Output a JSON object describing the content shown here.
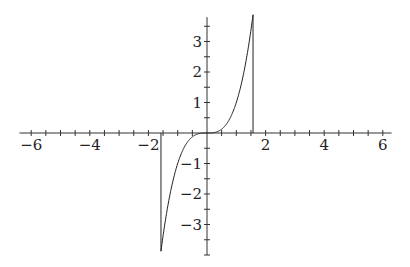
{
  "chart_data": {
    "type": "line",
    "title": "",
    "xlabel": "",
    "ylabel": "",
    "function": "y = x^3",
    "domain": [
      -1.5708,
      1.5708
    ],
    "xlim": [
      -6.4,
      6.3
    ],
    "ylim": [
      -4.0,
      3.8
    ],
    "grid": false,
    "legend": null,
    "x_ticks_major": [
      -6,
      -4,
      -2,
      2,
      4,
      6
    ],
    "x_tick_labels": [
      "−6",
      "−4",
      "−2",
      "2",
      "4",
      "6"
    ],
    "x_tick_minor_step": 0.5,
    "y_ticks_major": [
      -3,
      -2,
      -1,
      1,
      2,
      3
    ],
    "y_tick_labels": [
      "−3",
      "−2",
      "−1",
      "1",
      "2",
      "3"
    ],
    "y_tick_minor_step": 0.5,
    "vertical_lines": [
      -1.5708,
      1.5708
    ],
    "series": [
      {
        "name": "x^3",
        "color": "#222222",
        "x": [
          -1.5708,
          -1.25,
          -1.0,
          -0.75,
          -0.5,
          -0.25,
          0,
          0.25,
          0.5,
          0.75,
          1.0,
          1.25,
          1.5708
        ],
        "y": [
          -3.876,
          -1.953,
          -1.0,
          -0.422,
          -0.125,
          -0.016,
          0,
          0.016,
          0.125,
          0.422,
          1.0,
          1.953,
          3.876
        ]
      }
    ]
  },
  "layout": {
    "origin_px": [
      207,
      133
    ],
    "x_scale_px": 29.3,
    "y_scale_px": 30.5,
    "axis_color": "#333333",
    "curve_color": "#222222"
  }
}
